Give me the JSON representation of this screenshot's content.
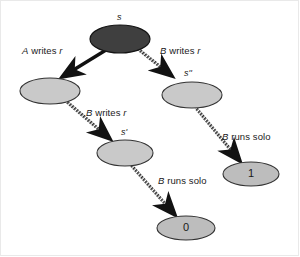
{
  "diagram": {
    "background": "#ffffff",
    "nodes": [
      {
        "id": "root",
        "label": "s",
        "label_pos": "above",
        "value": "",
        "fill": "#3f3f3f",
        "stroke": "#111111",
        "cx": 120,
        "cy": 39,
        "rx": 30,
        "ry": 14
      },
      {
        "id": "left",
        "label": "",
        "label_pos": "none",
        "value": "",
        "fill": "#c9c9c9",
        "stroke": "#333333",
        "cx": 50,
        "cy": 91,
        "rx": 30,
        "ry": 13
      },
      {
        "id": "right",
        "label": "s''",
        "label_pos": "above",
        "value": "",
        "fill": "#c9c9c9",
        "stroke": "#333333",
        "cx": 192,
        "cy": 95,
        "rx": 30,
        "ry": 13
      },
      {
        "id": "sp",
        "label": "s'",
        "label_pos": "above",
        "value": "",
        "fill": "#c9c9c9",
        "stroke": "#333333",
        "cx": 125,
        "cy": 153,
        "rx": 28,
        "ry": 13
      },
      {
        "id": "one",
        "label": "",
        "label_pos": "none",
        "value": "1",
        "fill": "#bdbdbd",
        "stroke": "#333333",
        "cx": 251,
        "cy": 174,
        "rx": 28,
        "ry": 12
      },
      {
        "id": "zero",
        "label": "",
        "label_pos": "none",
        "value": "0",
        "fill": "#bdbdbd",
        "stroke": "#333333",
        "cx": 186,
        "cy": 228,
        "rx": 29,
        "ry": 12
      }
    ],
    "edges": [
      {
        "id": "root-left",
        "from": "root",
        "to": "left",
        "style": "solid",
        "label": "A writes r",
        "label_x": 22,
        "label_y": 46
      },
      {
        "id": "root-right",
        "from": "root",
        "to": "right",
        "style": "hatched",
        "label": "B writes r",
        "label_x": 161,
        "label_y": 46
      },
      {
        "id": "left-sp",
        "from": "left",
        "to": "sp",
        "style": "hatched",
        "label": "B writes r",
        "label_x": 87,
        "label_y": 110
      },
      {
        "id": "right-one",
        "from": "right",
        "to": "one",
        "style": "hatched",
        "label": "B runs solo",
        "label_x": 222,
        "label_y": 135
      },
      {
        "id": "sp-zero",
        "from": "sp",
        "to": "zero",
        "style": "hatched",
        "label": "B runs solo",
        "label_x": 159,
        "label_y": 178
      }
    ],
    "edge_labels": {
      "a_writes_r": "A writes r",
      "b_writes_r_right": "B writes r",
      "b_writes_r_mid": "B writes r",
      "b_runs_solo_right": "B runs solo",
      "b_runs_solo_bottom": "B runs solo"
    },
    "node_labels": {
      "root": "s",
      "s_double_prime": "s''",
      "s_prime": "s'",
      "one": "1",
      "zero": "0"
    }
  }
}
